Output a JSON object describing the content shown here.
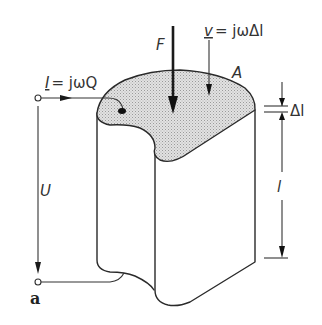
{
  "figure": {
    "panel_label": "a",
    "colors": {
      "stroke": "#2a2a2a",
      "top_surface_fill": "#d9d9d9",
      "background": "#ffffff"
    }
  },
  "labels": {
    "current": {
      "symbol": "I",
      "rhs": "= jωQ"
    },
    "force": "F",
    "velocity": {
      "symbol": "v",
      "rhs": "= jωΔl"
    },
    "area": "A",
    "delta_l": "Δl",
    "length": "l",
    "voltage": "U"
  },
  "elements": [
    {
      "name": "top-terminal",
      "type": "terminal"
    },
    {
      "name": "bottom-terminal",
      "type": "terminal"
    },
    {
      "name": "piezo-body",
      "type": "solid-body"
    },
    {
      "name": "top-electrode-surface",
      "type": "surface",
      "label": "A"
    },
    {
      "name": "force-arrow",
      "type": "arrow",
      "label": "F"
    },
    {
      "name": "velocity-arrow",
      "type": "arrow",
      "label": "v = jωΔl"
    },
    {
      "name": "current-arrow",
      "type": "arrow",
      "label": "I = jωQ"
    },
    {
      "name": "voltage-arrow",
      "type": "arrow",
      "label": "U"
    },
    {
      "name": "delta-l-dimension",
      "type": "dimension",
      "label": "Δl"
    },
    {
      "name": "length-dimension",
      "type": "dimension",
      "label": "l"
    }
  ]
}
